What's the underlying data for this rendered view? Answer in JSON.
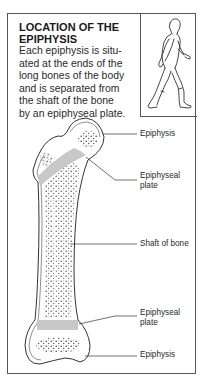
{
  "panel": {
    "title_line1": "LOCATION OF THE",
    "title_line2": "EPIPHYSIS",
    "body_lines": [
      "Each epiphysis is situ-",
      "ated at the ends of the",
      "long bones of the body",
      "and is separated from",
      "the shaft of the bone",
      "by an epiphyseal plate."
    ]
  },
  "figure": {
    "icon": "walking-person-icon"
  },
  "diagram": {
    "icon": "femur-bone-icon",
    "labels": [
      {
        "line1": "Epiphysis",
        "line2": ""
      },
      {
        "line1": "Epiphyseal",
        "line2": "plate"
      },
      {
        "line1": "Shaft of bone",
        "line2": ""
      },
      {
        "line1": "Epiphyseal",
        "line2": "plate"
      },
      {
        "line1": "Epiphysis",
        "line2": ""
      }
    ],
    "colors": {
      "outline": "#333333",
      "plate": "#c8c8c8",
      "dots": "#444444"
    }
  }
}
